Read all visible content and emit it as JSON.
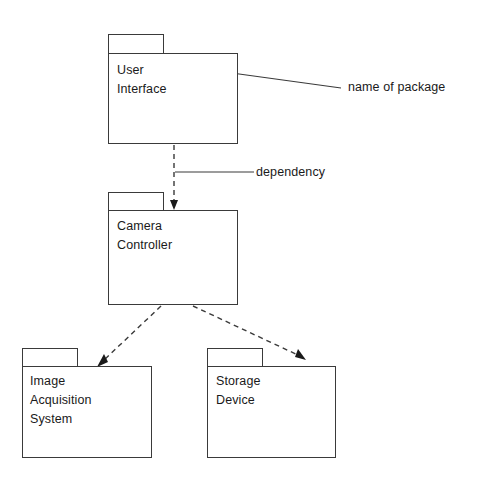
{
  "diagram": {
    "type": "uml-package-diagram",
    "title": "",
    "background_color": "#ffffff",
    "stroke_color": "#3a3a3a",
    "text_color": "#1a1a1a"
  },
  "packages": [
    {
      "id": "user-interface",
      "label": "User Interface",
      "tab": {
        "x": 108,
        "y": 34,
        "w": 56,
        "h": 19
      },
      "body": {
        "x": 108,
        "y": 53,
        "w": 130,
        "h": 91
      },
      "label_pos": {
        "x": 117,
        "y": 61
      }
    },
    {
      "id": "camera-controller",
      "label": "Camera\nController",
      "tab": {
        "x": 108,
        "y": 192,
        "w": 56,
        "h": 18
      },
      "body": {
        "x": 108,
        "y": 210,
        "w": 130,
        "h": 95
      },
      "label_pos": {
        "x": 117,
        "y": 217
      }
    },
    {
      "id": "image-acquisition-system",
      "label": "Image\nAcquisition\nSystem",
      "tab": {
        "x": 22,
        "y": 348,
        "w": 56,
        "h": 18
      },
      "body": {
        "x": 22,
        "y": 366,
        "w": 130,
        "h": 92
      },
      "label_pos": {
        "x": 30,
        "y": 372
      }
    },
    {
      "id": "storage-device",
      "label": "Storage Device",
      "tab": {
        "x": 207,
        "y": 348,
        "w": 56,
        "h": 18
      },
      "body": {
        "x": 207,
        "y": 366,
        "w": 129,
        "h": 92
      },
      "label_pos": {
        "x": 216,
        "y": 372
      }
    }
  ],
  "dependencies": [
    {
      "id": "ui-to-camera",
      "from": "user-interface",
      "to": "camera-controller",
      "path": "M 174 145 L 174 204",
      "arrow": "M 174 210 L 170 200 L 178 200 Z"
    },
    {
      "id": "camera-to-image-acquisition",
      "from": "camera-controller",
      "to": "image-acquisition-system",
      "path": "M 161 306 L 103 361",
      "arrow": "M 97 367 L 108 362 L 104 354 Z"
    },
    {
      "id": "camera-to-storage-device",
      "from": "camera-controller",
      "to": "storage-device",
      "path": "M 193 306 L 300 356",
      "arrow": "M 306 360 L 295 357 L 298 349 Z"
    }
  ],
  "annotations": [
    {
      "id": "name-of-package",
      "text": "name of package",
      "text_pos": {
        "x": 348,
        "y": 80
      },
      "leader": "M 210 70 L 341 88"
    },
    {
      "id": "dependency",
      "text": "dependency",
      "text_pos": {
        "x": 256,
        "y": 165
      },
      "leader": "M 175 172 L 254 172"
    }
  ]
}
